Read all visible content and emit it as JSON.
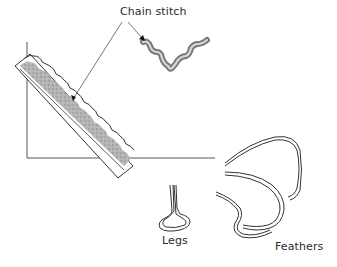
{
  "diagram": {
    "labels": {
      "chain_stitch": "Chain stitch",
      "legs": "Legs",
      "feathers": "Feathers"
    },
    "colors": {
      "line": "#3a3a3a",
      "fill_gray": "#a8a8a8",
      "stitch_gray": "#8c8c8c",
      "background": "#ffffff"
    }
  }
}
